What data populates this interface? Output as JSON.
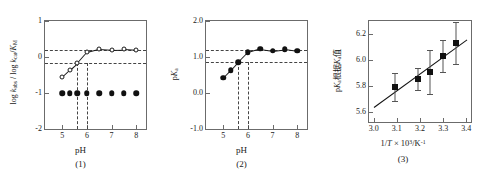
{
  "figure": {
    "panel_count": 3
  },
  "chart_data": [
    {
      "type": "scatter",
      "panel": "1",
      "caption": "(1)",
      "xlabel": "pH",
      "ylabel": "log k_obs / log k_cat / K_M",
      "ylabel_parts": {
        "pre": "log ",
        "k1": "k",
        "k1sub": "obs",
        "mid": " / log ",
        "k2": "k",
        "k2sub": "cat",
        "slash": "/",
        "k3": "K",
        "k3sub": "M"
      },
      "xlim": [
        4.3,
        8.4
      ],
      "ylim": [
        -2,
        1
      ],
      "xticks": [
        "5",
        "6",
        "7",
        "8"
      ],
      "xtick_values": [
        5,
        6,
        7,
        8
      ],
      "yticks": [
        "1",
        "0",
        "-1",
        "-2"
      ],
      "ytick_values": [
        1,
        0,
        -1,
        -2
      ],
      "grid": false,
      "legend": "none",
      "series": [
        {
          "name": "open-circle-series",
          "marker": "open-circle",
          "connected": true,
          "x": [
            5.0,
            5.3,
            5.6,
            6.0,
            6.5,
            7.0,
            7.5,
            8.0
          ],
          "y": [
            -0.55,
            -0.36,
            -0.18,
            0.13,
            0.22,
            0.2,
            0.21,
            0.19
          ]
        },
        {
          "name": "filled-circle-series",
          "marker": "filled-circle",
          "connected": false,
          "x": [
            5.0,
            5.3,
            5.6,
            6.0,
            6.5,
            7.0,
            7.5,
            8.0
          ],
          "y": [
            -1.0,
            -1.0,
            -1.0,
            -1.0,
            -1.0,
            -1.0,
            -1.0,
            -1.0
          ]
        }
      ],
      "guides": {
        "horizontal": [
          0.2,
          -0.18
        ],
        "vertical": [
          5.6,
          6.0
        ]
      }
    },
    {
      "type": "scatter",
      "panel": "2",
      "caption": "(2)",
      "xlabel": "pH",
      "ylabel": "pK_a",
      "ylabel_parts": {
        "pre": "p",
        "k": "K",
        "ksub": "a"
      },
      "xlim": [
        4.3,
        8.4
      ],
      "ylim": [
        -1.0,
        2.0
      ],
      "xticks": [
        "5",
        "6",
        "7",
        "8"
      ],
      "xtick_values": [
        5,
        6,
        7,
        8
      ],
      "yticks": [
        "2.0",
        "1.0",
        "0.0",
        "-1.0"
      ],
      "ytick_values": [
        2.0,
        1.0,
        0.0,
        -1.0
      ],
      "grid": false,
      "legend": "none",
      "series": [
        {
          "name": "pka-series",
          "marker": "filled-circle",
          "connected": true,
          "x": [
            5.0,
            5.3,
            5.6,
            6.0,
            6.5,
            7.0,
            7.5,
            8.0
          ],
          "y": [
            0.42,
            0.63,
            0.85,
            1.13,
            1.23,
            1.18,
            1.22,
            1.17
          ]
        }
      ],
      "guides": {
        "horizontal": [
          1.2,
          0.85
        ],
        "vertical": [
          5.6,
          6.0
        ]
      }
    },
    {
      "type": "scatter",
      "panel": "3",
      "caption": "(3)",
      "xlabel": "1/T × 10³/K⁻¹",
      "xlabel_parts": {
        "inv": "1/",
        "T": "T",
        "times": " × 10",
        "exp": "3",
        "unit": "/K",
        "unitexp": "-1"
      },
      "ylabel": "pK 根据K 值",
      "ylabel_parts": {
        "pre": "p",
        "K": "K",
        "Ksub": "a",
        "cjk1": "根据",
        "K2": "K",
        "K2sub": "a",
        "cjk2": "值"
      },
      "xlim": [
        2.98,
        3.42
      ],
      "ylim": [
        5.52,
        6.3
      ],
      "xticks": [
        "3.0",
        "3.1",
        "3.2",
        "3.3",
        "3.4"
      ],
      "xtick_values": [
        3.0,
        3.1,
        3.2,
        3.3,
        3.4
      ],
      "yticks": [
        "5.6",
        "5.8",
        "6.0",
        "6.2"
      ],
      "ytick_values": [
        5.6,
        5.8,
        6.0,
        6.2
      ],
      "grid": false,
      "legend": "none",
      "series": [
        {
          "name": "arrhenius-points",
          "marker": "filled-square",
          "connected": false,
          "x": [
            3.09,
            3.19,
            3.245,
            3.3,
            3.355
          ],
          "y": [
            5.79,
            5.855,
            5.905,
            6.03,
            6.13
          ],
          "yerr": [
            0.105,
            0.085,
            0.17,
            0.125,
            0.165
          ]
        }
      ],
      "fit_line": {
        "name": "linear-regression",
        "x_start": 3.0,
        "y_start": 5.635,
        "x_end": 3.4,
        "y_end": 6.155
      }
    }
  ]
}
